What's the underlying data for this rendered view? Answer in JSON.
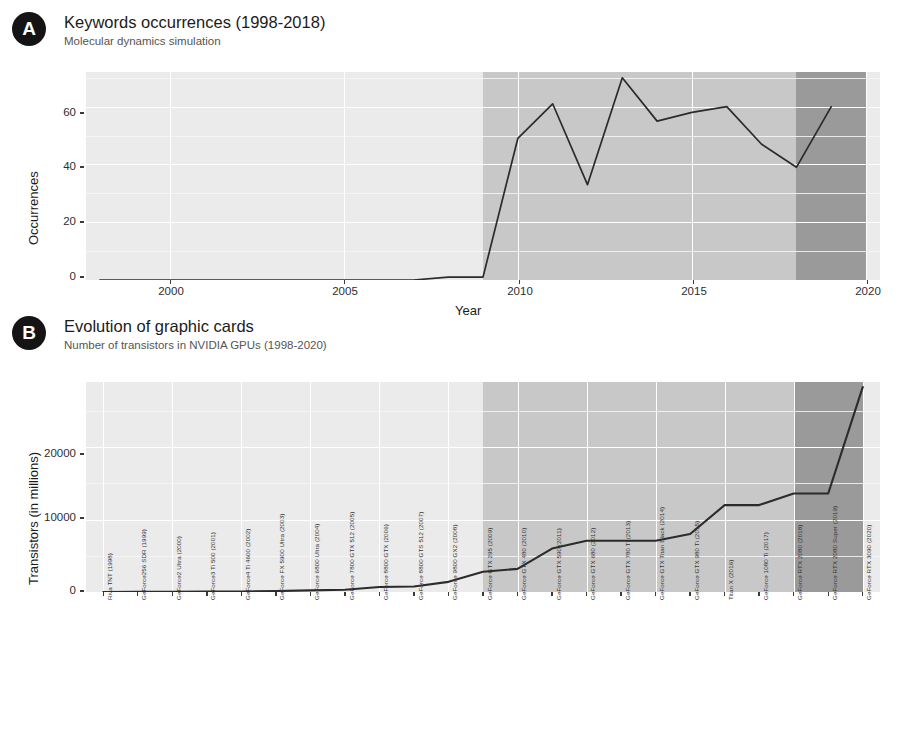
{
  "panels": {
    "a": {
      "badge": "A",
      "title": "Keywords occurrences (1998-2018)",
      "subtitle": "Molecular dynamics simulation"
    },
    "b": {
      "badge": "B",
      "title": "Evolution of graphic cards",
      "subtitle": "Number of transistors in NVIDIA GPUs (1998-2020)"
    }
  },
  "colors": {
    "plot_background": "#ebebeb",
    "band_mid": "#c8c8c8",
    "band_dark": "#9a9a9a",
    "gridline": "#ffffff",
    "line": "#2b2b2b",
    "badge": "#141414",
    "title_text": "#1b1b1b",
    "subtitle_text": "#555555"
  },
  "chart_data": [
    {
      "type": "line",
      "panel": "A",
      "title": "Keywords occurrences (1998-2018)",
      "subtitle": "Molecular dynamics simulation",
      "xlabel": "Year",
      "ylabel": "Occurrences",
      "xlim": [
        1997.6,
        2020.4
      ],
      "ylim": [
        0,
        72
      ],
      "xticks": [
        2000,
        2005,
        2010,
        2015,
        2020
      ],
      "yticks": [
        0,
        20,
        40,
        60
      ],
      "grid": true,
      "legend": "none",
      "x": [
        1998,
        1999,
        2000,
        2001,
        2002,
        2003,
        2004,
        2005,
        2006,
        2007,
        2008,
        2009,
        2010,
        2011,
        2012,
        2013,
        2014,
        2015,
        2016,
        2017,
        2018,
        2019
      ],
      "values": [
        0,
        0,
        0,
        0,
        0,
        0,
        0,
        0,
        0,
        0,
        1,
        1,
        49,
        61,
        33,
        70,
        55,
        58,
        60,
        47,
        39,
        60
      ],
      "shaded_regions": [
        {
          "name": "mid-band",
          "from": 2009,
          "to": 2018,
          "color": "#c8c8c8"
        },
        {
          "name": "dark-band",
          "from": 2018,
          "to": 2020,
          "color": "#9a9a9a"
        }
      ]
    },
    {
      "type": "line",
      "panel": "B",
      "title": "Evolution of graphic cards",
      "subtitle": "Number of transistors in NVIDIA GPUs (1998-2020)",
      "xlabel": "",
      "ylabel": "Transistors (in millions)",
      "ylim": [
        0,
        29000
      ],
      "yticks": [
        0,
        10000,
        20000
      ],
      "grid": true,
      "legend": "none",
      "categories": [
        "Riva TNT (1998)",
        "GeForce256 SDR (1999)",
        "GeForce2 Ultra (2000)",
        "GeForce3 Ti 500 (2001)",
        "GeForce4 Ti 4600 (2002)",
        "GeForce FX 5900 Ultra (2003)",
        "GeForce 6800 Ultra (2004)",
        "GeForce 7800 GTX 512 (2005)",
        "GeForce 8800 GTX (2006)",
        "GeForce 8800 GTS 512 (2007)",
        "GeForce 9800 GX2 (2008)",
        "GeForce GTX 295 (2009)",
        "GeForce GTX 480 (2010)",
        "GeForce GTX 590 (2011)",
        "GeForce GTX 680 (2012)",
        "GeForce GTX 780 Ti (2013)",
        "GeForce GTX Titan Black (2014)",
        "GeForce GTX 980 Ti (2015)",
        "Titan X (2016)",
        "GeForce 1080 Ti (2017)",
        "GeForce RTX 2080 (2018)",
        "GeForce RTX 2080 Super (2019)",
        "GeForce RTX 3090 (2020)"
      ],
      "values": [
        7,
        17,
        25,
        57,
        63,
        130,
        222,
        302,
        681,
        754,
        1400,
        2800,
        3200,
        6000,
        7080,
        7080,
        7080,
        8000,
        12000,
        12000,
        13600,
        13600,
        28300
      ],
      "shaded_regions": [
        {
          "name": "mid-band",
          "from_index": 11,
          "to_index": 20,
          "color": "#c8c8c8"
        },
        {
          "name": "dark-band",
          "from_index": 20,
          "to_index": 22,
          "color": "#9a9a9a"
        }
      ]
    }
  ]
}
